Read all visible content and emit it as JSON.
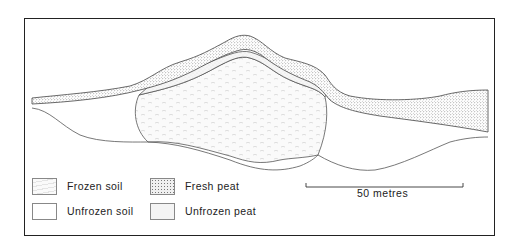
{
  "figure": {
    "type": "cross-section diagram of palsa / peat mound with frozen soil core",
    "legend": [
      {
        "key": "frozen_soil",
        "label": "Frozen soil",
        "pattern": "dashes",
        "fill": "#f4f4f4"
      },
      {
        "key": "fresh_peat",
        "label": "Fresh peat",
        "pattern": "dense-dots",
        "fill": "#e6e6e6"
      },
      {
        "key": "unfrozen_soil",
        "label": "Unfrozen soil",
        "pattern": "none",
        "fill": "#ffffff"
      },
      {
        "key": "unfrozen_peat",
        "label": "Unfrozen peat",
        "pattern": "light-dots",
        "fill": "#efefef"
      }
    ],
    "scale_bar": {
      "label": "50 metres"
    },
    "colors": {
      "line": "#444444",
      "frame": "#222222"
    }
  }
}
